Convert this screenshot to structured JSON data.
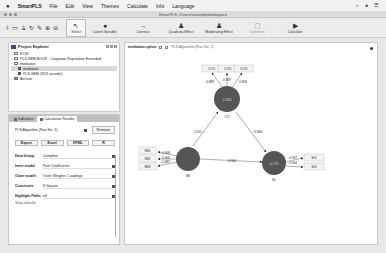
{
  "menubar": {
    "apple": "",
    "app": "SmartPLS",
    "items": [
      "File",
      "Edit",
      "View",
      "Themes",
      "Calculate",
      "Info",
      "Language"
    ],
    "status_icons": [
      "search-icon",
      "user-icon",
      "menu-icon"
    ]
  },
  "window": {
    "title": "SmartPLS: /Users/smartpls/workspace"
  },
  "toolbar": {
    "buttons": [
      {
        "label": "Select",
        "icon": "cursor-icon"
      },
      {
        "label": "Latent Variable",
        "icon": "circle-icon"
      },
      {
        "label": "Connect",
        "icon": "arrow-icon"
      },
      {
        "label": "Quadratic Effect",
        "icon": "person-icon"
      },
      {
        "label": "Moderating Effect",
        "icon": "person-icon"
      },
      {
        "label": "Comment",
        "icon": "comment-icon"
      },
      {
        "label": "Calculate",
        "icon": "play-icon"
      }
    ]
  },
  "project_explorer": {
    "title": "Project Explorer",
    "tree": [
      {
        "label": "ECSI",
        "level": 0,
        "toggle": "+"
      },
      {
        "label": "PLS-SEM BOOK - Corporate Reputation Extended",
        "level": 0,
        "toggle": "+"
      },
      {
        "label": "mediation",
        "level": 0,
        "toggle": "−"
      },
      {
        "label": "mediation",
        "level": 1,
        "selected": true
      },
      {
        "label": "PLS-SEM (XXX records)",
        "level": 1
      },
      {
        "label": "Archive",
        "level": 0,
        "toggle": "+"
      }
    ]
  },
  "results_panel": {
    "tabs": [
      {
        "label": "Indicators"
      },
      {
        "label": "Calculation Results",
        "active": true
      }
    ],
    "algorithm": "PLS Algorithm (Run No. 1)",
    "remove_label": "Remove",
    "export_buttons": [
      "Export",
      "Excel",
      "HTML",
      "R"
    ],
    "properties": [
      {
        "key": "Data Group",
        "value": "Complete"
      },
      {
        "key": "Inner model",
        "value": "Path Coefficients"
      },
      {
        "key": "Outer model",
        "value": "Outer Weights / Loadings"
      },
      {
        "key": "Constructs",
        "value": "R Square"
      },
      {
        "key": "Highlight Paths",
        "value": "off"
      }
    ],
    "show_defaults": "Show defaults"
  },
  "canvas": {
    "tabs": [
      {
        "label": "mediation.splsm"
      },
      {
        "label": "PLS Algorithm (Run No. 1)"
      }
    ],
    "nodes": {
      "CO": {
        "label": "CO",
        "value": "0.334"
      },
      "IM": {
        "label": "IM",
        "value": ""
      },
      "SL": {
        "label": "SL",
        "value": "0.770"
      }
    },
    "indicators": {
      "CO1": "CO1",
      "CO2": "CO2",
      "CO3": "CO3",
      "IM1": "IM1",
      "IM2": "IM2",
      "IM3": "IM3",
      "SI1": "SI1",
      "SI2": "SI2"
    },
    "loadings": {
      "CO1": "0.889",
      "CO2": "0.929",
      "CO3": "0.856",
      "IM1": "0.908",
      "IM2": "0.905",
      "IM3": "0.887",
      "SI1": "0.937",
      "SI2": "0.944"
    },
    "paths": {
      "IM_CO": "0.511",
      "CO_SL": "0.364",
      "IM_SL": "0.564"
    }
  }
}
